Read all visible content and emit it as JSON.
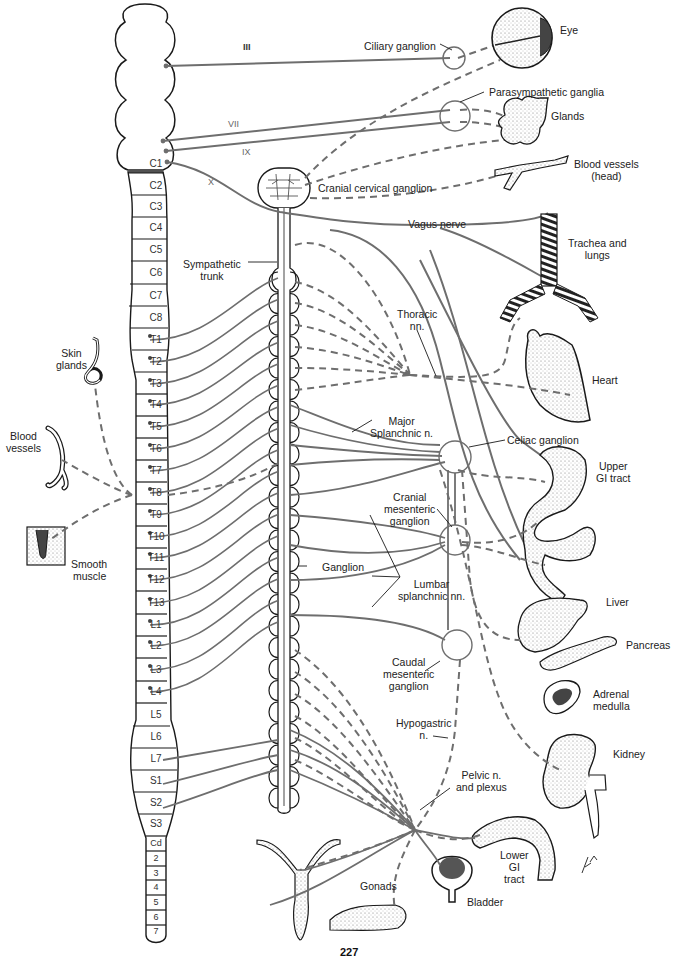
{
  "figure": {
    "stroke_color": "#6e6e6e",
    "outline_color": "#1a1a1a",
    "page_number_partial": "227"
  },
  "cranial_nerves": [
    {
      "id": "III",
      "label": "III",
      "x": 240,
      "y": 48
    },
    {
      "id": "VII",
      "label": "VII",
      "x": 230,
      "y": 123
    },
    {
      "id": "IX",
      "label": "IX",
      "x": 242,
      "y": 150
    },
    {
      "id": "X",
      "label": "X",
      "x": 208,
      "y": 178
    }
  ],
  "spinal_segments": [
    {
      "label": "C1",
      "y": 164
    },
    {
      "label": "C2",
      "y": 186
    },
    {
      "label": "C3",
      "y": 207
    },
    {
      "label": "C4",
      "y": 228
    },
    {
      "label": "C5",
      "y": 250
    },
    {
      "label": "C6",
      "y": 273
    },
    {
      "label": "C7",
      "y": 296
    },
    {
      "label": "C8",
      "y": 318
    },
    {
      "label": "T1",
      "y": 340
    },
    {
      "label": "T2",
      "y": 362
    },
    {
      "label": "T3",
      "y": 384
    },
    {
      "label": "T4",
      "y": 405
    },
    {
      "label": "T5",
      "y": 427
    },
    {
      "label": "T6",
      "y": 449
    },
    {
      "label": "T7",
      "y": 471
    },
    {
      "label": "T8",
      "y": 493
    },
    {
      "label": "T9",
      "y": 515
    },
    {
      "label": "T10",
      "y": 537
    },
    {
      "label": "T11",
      "y": 558
    },
    {
      "label": "T12",
      "y": 580
    },
    {
      "label": "T13",
      "y": 603
    },
    {
      "label": "L1",
      "y": 625
    },
    {
      "label": "L2",
      "y": 646
    },
    {
      "label": "L3",
      "y": 670
    },
    {
      "label": "L4",
      "y": 692
    },
    {
      "label": "L5",
      "y": 715
    },
    {
      "label": "L6",
      "y": 737
    },
    {
      "label": "L7",
      "y": 759
    },
    {
      "label": "S1",
      "y": 781
    },
    {
      "label": "S2",
      "y": 803
    },
    {
      "label": "S3",
      "y": 824
    },
    {
      "label": "Cd",
      "y": 843
    },
    {
      "label": "2",
      "y": 858
    },
    {
      "label": "3",
      "y": 873
    },
    {
      "label": "4",
      "y": 887
    },
    {
      "label": "5",
      "y": 902
    },
    {
      "label": "6",
      "y": 917
    },
    {
      "label": "7",
      "y": 931
    }
  ],
  "labels": {
    "ciliary_ganglion": "Ciliary ganglion",
    "eye": "Eye",
    "parasympathetic_ganglia": "Parasympathetic ganglia",
    "glands": "Glands",
    "blood_vessels_head": [
      "Blood vessels",
      "(head)"
    ],
    "cranial_cervical_ganglion": "Cranial cervical ganglion",
    "vagus_nerve": "Vagus nerve",
    "trachea_and_lungs": [
      "Trachea and",
      "lungs"
    ],
    "sympathetic_trunk": [
      "Sympathetic",
      "trunk"
    ],
    "thoracic_nn": [
      "Thoracic",
      "nn."
    ],
    "heart": "Heart",
    "skin_glands": [
      "Skin",
      "glands"
    ],
    "blood_vessels": [
      "Blood",
      "vessels"
    ],
    "smooth_muscle": [
      "Smooth",
      "muscle"
    ],
    "major_splanchnic": [
      "Major",
      "Splanchnic n."
    ],
    "celiac_ganglion": "Celiac ganglion",
    "upper_gi_tract": [
      "Upper",
      "GI tract"
    ],
    "cranial_mesenteric_ganglion": [
      "Cranial",
      "mesenteric",
      "ganglion"
    ],
    "ganglion": "Ganglion",
    "lumbar_splanchnic": [
      "Lumbar",
      "splanchnic nn."
    ],
    "liver": "Liver",
    "pancreas": "Pancreas",
    "caudal_mesenteric_ganglion": [
      "Caudal",
      "mesenteric",
      "ganglion"
    ],
    "adrenal_medulla": [
      "Adrenal",
      "medulla"
    ],
    "hypogastric_n": [
      "Hypogastric",
      "n."
    ],
    "kidney": "Kidney",
    "pelvic_n_and_plexus": [
      "Pelvic n.",
      "and plexus"
    ],
    "lower_gi_tract": [
      "Lower",
      "GI",
      "tract"
    ],
    "gonads": "Gonads",
    "bladder": "Bladder"
  }
}
